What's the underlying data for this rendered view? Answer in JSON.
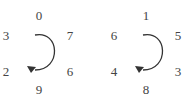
{
  "diagrams": [
    {
      "name": "left-dial",
      "top": "0",
      "upper_left": "3",
      "upper_right": "7",
      "lower_left": "2",
      "lower_right": "6",
      "bottom": "9",
      "rotation": "clockwise"
    },
    {
      "name": "right-dial",
      "top": "1",
      "upper_left": "6",
      "upper_right": "5",
      "lower_left": "4",
      "lower_right": "3",
      "bottom": "8",
      "rotation": "clockwise"
    }
  ],
  "colors": {
    "text": "#444444",
    "arrow": "#333333"
  }
}
